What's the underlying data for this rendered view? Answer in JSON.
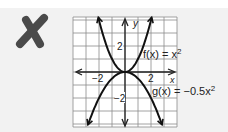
{
  "verdict": {
    "icon": "x-mark-icon",
    "color": "#4a4a4a"
  },
  "chart_data": {
    "type": "line",
    "title": "",
    "xlabel": "x",
    "ylabel": "y",
    "xlim": [
      -4,
      4
    ],
    "ylim": [
      -4.2,
      4.2
    ],
    "grid": true,
    "x_ticks": [
      {
        "value": -2,
        "label": "−2"
      },
      {
        "value": 2,
        "label": "2"
      }
    ],
    "y_ticks": [
      {
        "value": 2,
        "label": "2"
      },
      {
        "value": -2,
        "label": "−2"
      }
    ],
    "series": [
      {
        "name": "f(x) = x²",
        "expr": "x^2",
        "label_base": "f(x) = x",
        "label_exp": "2",
        "x": [
          -2.05,
          -1.5,
          -1,
          -0.5,
          0,
          0.5,
          1,
          1.5,
          2.05
        ],
        "y": [
          4.2,
          2.25,
          1,
          0.25,
          0,
          0.25,
          1,
          2.25,
          4.2
        ]
      },
      {
        "name": "g(x) = −0.5x²",
        "expr": "-0.5x^2",
        "label_base": "g(x) = −0.5x",
        "label_exp": "2",
        "x": [
          -2.85,
          -2,
          -1,
          0,
          1,
          2,
          2.85
        ],
        "y": [
          -4.05,
          -2,
          -0.5,
          0,
          -0.5,
          -2,
          -4.05
        ]
      }
    ],
    "legend": "inline labels right of curves"
  }
}
